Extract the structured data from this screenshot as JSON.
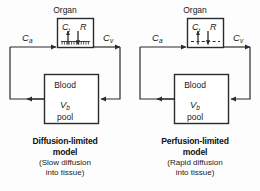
{
  "figure": {
    "background_color": "#fdfdfd",
    "stroke_color": "#2b2b2b"
  },
  "panels": [
    {
      "id": "diffusion-limited",
      "organ_label": "Organ",
      "tissue_conc_symbol": "C",
      "tissue_conc_subscript": "t",
      "resistance_symbol": "R",
      "arterial_symbol": "C",
      "arterial_subscript": "a",
      "venous_symbol": "C",
      "venous_subscript": "v",
      "blood_label": "Blood",
      "blood_volume_symbol": "V",
      "blood_volume_subscript": "b",
      "pool_label": "pool",
      "barrier_style": "hatched",
      "caption_title_line1": "Diffusion-limited",
      "caption_title_line2": "model",
      "caption_sub_line1": "(Slow diffusion",
      "caption_sub_line2": "into tissue)"
    },
    {
      "id": "perfusion-limited",
      "organ_label": "Organ",
      "tissue_conc_symbol": "C",
      "tissue_conc_subscript": "t",
      "resistance_symbol": "R",
      "arterial_symbol": "C",
      "arterial_subscript": "a",
      "venous_symbol": "C",
      "venous_subscript": "v",
      "blood_label": "Blood",
      "blood_volume_symbol": "V",
      "blood_volume_subscript": "b",
      "pool_label": "pool",
      "barrier_style": "dashed",
      "caption_title_line1": "Perfusion-limited",
      "caption_title_line2": "model",
      "caption_sub_line1": "(Rapid diffusion",
      "caption_sub_line2": "into tissue)"
    }
  ]
}
